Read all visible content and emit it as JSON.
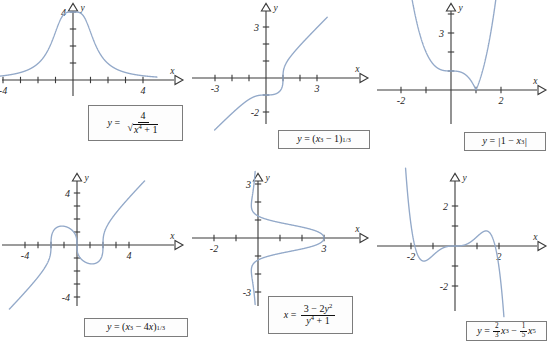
{
  "figure": {
    "curve_color": "#93a9c9",
    "axis_color": "#3a3a3a",
    "panels": [
      {
        "id": "panel-1",
        "equation_text": "y = 4 / sqrt(x^4 + 1)",
        "axis_labels": {
          "x": "x",
          "y": "y"
        },
        "x_tick_labels": [
          "-4",
          "4"
        ],
        "y_tick_labels": [
          "4"
        ]
      },
      {
        "id": "panel-2",
        "equation_text": "y = (x^3 - 1)^(1/3)",
        "axis_labels": {
          "x": "x",
          "y": "y"
        },
        "x_tick_labels": [
          "-3",
          "3"
        ],
        "y_tick_labels": [
          "3",
          "-2"
        ]
      },
      {
        "id": "panel-3",
        "equation_text": "y = |1 - x^3|",
        "axis_labels": {
          "x": "x",
          "y": "y"
        },
        "x_tick_labels": [
          "-2",
          "2"
        ],
        "y_tick_labels": [
          "3"
        ]
      },
      {
        "id": "panel-4",
        "equation_text": "y = (x^3 - 4x)^(1/3)",
        "axis_labels": {
          "x": "x",
          "y": "y"
        },
        "x_tick_labels": [
          "-4",
          "4"
        ],
        "y_tick_labels": [
          "4",
          "-4"
        ]
      },
      {
        "id": "panel-5",
        "equation_text": "x = (3 - 2y^2) / (y^4 + 1)",
        "axis_labels": {
          "x": "x",
          "y": "y"
        },
        "x_tick_labels": [
          "-2",
          "3"
        ],
        "y_tick_labels": [
          "3",
          "-3"
        ]
      },
      {
        "id": "panel-6",
        "equation_text": "y = (2/3)x^3 - (1/5)x^5",
        "axis_labels": {
          "x": "x",
          "y": "y"
        },
        "x_tick_labels": [
          "-2",
          "2"
        ],
        "y_tick_labels": [
          "2",
          "-2"
        ]
      }
    ]
  },
  "chart_data": [
    {
      "type": "line",
      "id": "panel-1",
      "title": "y = 4/√(x⁴ + 1)",
      "expression": "4/Math.sqrt(Math.pow(x,4)+1)",
      "xlabel": "x",
      "ylabel": "y",
      "xlim": [
        -4.8,
        4.8
      ],
      "ylim": [
        -1.2,
        4.9
      ],
      "xticks": [
        -4,
        -3,
        -2,
        -1,
        1,
        2,
        3,
        4
      ],
      "yticks": [
        1,
        2,
        3,
        4
      ],
      "xtick_labels": {
        "-4": "-4",
        "4": "4"
      },
      "ytick_labels": {
        "4": "4"
      },
      "grid": false,
      "legend": "none",
      "sample_points": [
        {
          "x": -4,
          "y": 0.25
        },
        {
          "x": -3,
          "y": 0.444
        },
        {
          "x": -2,
          "y": 0.97
        },
        {
          "x": -1,
          "y": 2.83
        },
        {
          "x": 0,
          "y": 4.0
        },
        {
          "x": 1,
          "y": 2.83
        },
        {
          "x": 2,
          "y": 0.97
        },
        {
          "x": 3,
          "y": 0.444
        },
        {
          "x": 4,
          "y": 0.25
        }
      ]
    },
    {
      "type": "line",
      "id": "panel-2",
      "title": "y = (x³ − 1)^(1/3)",
      "expression": "Math.cbrt(Math.pow(x,3)-1)",
      "xlabel": "x",
      "ylabel": "y",
      "xlim": [
        -3.6,
        3.6
      ],
      "ylim": [
        -3.6,
        3.6
      ],
      "xticks": [
        -3,
        -2,
        -1,
        1,
        2,
        3
      ],
      "yticks": [
        -3,
        -2,
        -1,
        1,
        2,
        3
      ],
      "xtick_labels": {
        "-3": "-3",
        "3": "3"
      },
      "ytick_labels": {
        "3": "3",
        "-2": "-2"
      },
      "grid": false,
      "legend": "none",
      "sample_points": [
        {
          "x": -3,
          "y": -3.037
        },
        {
          "x": -2,
          "y": -2.08
        },
        {
          "x": -1,
          "y": -1.26
        },
        {
          "x": 0,
          "y": -1.0
        },
        {
          "x": 1,
          "y": 0.0
        },
        {
          "x": 2,
          "y": 1.913
        },
        {
          "x": 3,
          "y": 2.962
        }
      ]
    },
    {
      "type": "line",
      "id": "panel-3",
      "title": "y = |1 − x³|",
      "expression": "Math.abs(1-Math.pow(x,3))",
      "xlabel": "x",
      "ylabel": "y",
      "xlim": [
        -2.6,
        2.6
      ],
      "ylim": [
        -1.4,
        4.6
      ],
      "xticks": [
        -2,
        -1,
        1,
        2
      ],
      "yticks": [
        1,
        2,
        3,
        4
      ],
      "xtick_labels": {
        "-2": "-2",
        "2": "2"
      },
      "ytick_labels": {
        "3": "3"
      },
      "grid": false,
      "legend": "none",
      "sample_points": [
        {
          "x": -1.6,
          "y": 5.096
        },
        {
          "x": -1,
          "y": 2.0
        },
        {
          "x": 0,
          "y": 1.0
        },
        {
          "x": 1,
          "y": 0.0
        },
        {
          "x": 1.5,
          "y": 2.375
        },
        {
          "x": 1.75,
          "y": 4.359
        }
      ]
    },
    {
      "type": "line",
      "id": "panel-4",
      "title": "y = (x³ − 4x)^(1/3)",
      "expression": "Math.cbrt(Math.pow(x,3)-4*x)",
      "xlabel": "x",
      "ylabel": "y",
      "xlim": [
        -5.2,
        5.2
      ],
      "ylim": [
        -5.2,
        5.2
      ],
      "xticks": [
        -4,
        -3,
        -2,
        -1,
        1,
        2,
        3,
        4
      ],
      "yticks": [
        -4,
        -3,
        -2,
        -1,
        1,
        2,
        3,
        4
      ],
      "xtick_labels": {
        "-4": "-4",
        "4": "4"
      },
      "ytick_labels": {
        "4": "4",
        "-4": "-4"
      },
      "grid": false,
      "legend": "none",
      "sample_points": [
        {
          "x": -4,
          "y": -3.63
        },
        {
          "x": -2,
          "y": 0.0
        },
        {
          "x": -1.155,
          "y": 1.41
        },
        {
          "x": 0,
          "y": 0.0
        },
        {
          "x": 1.155,
          "y": -1.41
        },
        {
          "x": 2,
          "y": 0.0
        },
        {
          "x": 4,
          "y": 3.63
        }
      ]
    },
    {
      "type": "line",
      "id": "panel-5",
      "title": "x = (3 − 2y²)/(y⁴ + 1)",
      "expression": "(3-2*Math.pow(t,2))/(Math.pow(t,4)+1)",
      "parametric_on": "y",
      "xlabel": "x",
      "ylabel": "y",
      "xlim": [
        -2.9,
        3.9
      ],
      "ylim": [
        -3.7,
        3.7
      ],
      "xticks": [
        -2,
        -1,
        1,
        2,
        3
      ],
      "yticks": [
        -3,
        -2,
        -1,
        1,
        2,
        3
      ],
      "xtick_labels": {
        "-2": "-2",
        "3": "3"
      },
      "ytick_labels": {
        "3": "3",
        "-3": "-3"
      },
      "grid": false,
      "legend": "none",
      "sample_points": [
        {
          "x": -0.26,
          "y": -3.4
        },
        {
          "x": -0.55,
          "y": -2.0
        },
        {
          "x": 0.5,
          "y": -1.0
        },
        {
          "x": 3.0,
          "y": 0.0
        },
        {
          "x": 0.5,
          "y": 1.0
        },
        {
          "x": -0.55,
          "y": 2.0
        },
        {
          "x": -0.26,
          "y": 3.4
        }
      ]
    },
    {
      "type": "line",
      "id": "panel-6",
      "title": "y = ⅔x³ − ⅕x⁵",
      "expression": "(2/3)*Math.pow(x,3)-(1/5)*Math.pow(x,5)",
      "xlabel": "x",
      "ylabel": "y",
      "xlim": [
        -3.0,
        3.0
      ],
      "ylim": [
        -3.2,
        3.2
      ],
      "xticks": [
        -2,
        -1,
        1,
        2
      ],
      "yticks": [
        -2,
        -1,
        1,
        2
      ],
      "xtick_labels": {
        "-2": "-2",
        "2": "2"
      },
      "ytick_labels": {
        "2": "2",
        "-2": "-2"
      },
      "grid": false,
      "legend": "none",
      "sample_points": [
        {
          "x": -2.3,
          "y": 3.3
        },
        {
          "x": -2,
          "y": 1.07
        },
        {
          "x": -1.826,
          "y": 0.0
        },
        {
          "x": -1.414,
          "y": -0.94
        },
        {
          "x": 0,
          "y": 0.0
        },
        {
          "x": 1.414,
          "y": 0.94
        },
        {
          "x": 1.826,
          "y": 0.0
        },
        {
          "x": 2,
          "y": -1.07
        },
        {
          "x": 2.3,
          "y": -3.3
        }
      ]
    }
  ]
}
